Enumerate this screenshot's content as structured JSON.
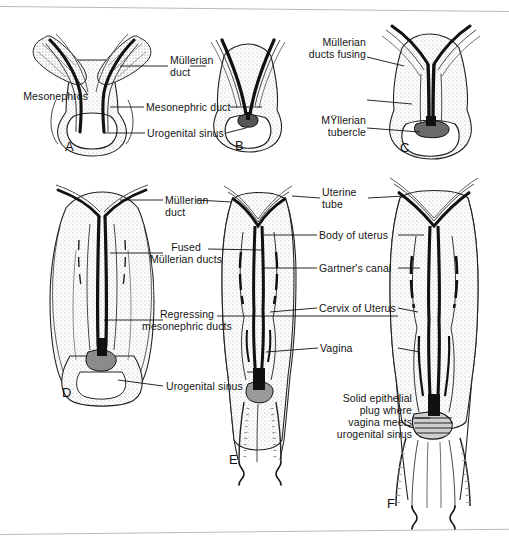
{
  "figure": {
    "background_color": "#ffffff",
    "ink_color": "#111111",
    "stipple_color": "#9a9a9a"
  },
  "panels": [
    {
      "id": "A",
      "letter": "A",
      "stage": "Paired Müllerian ducts alongside mesonephros"
    },
    {
      "id": "B",
      "letter": "B",
      "stage": "Müllerian ducts approaching midline"
    },
    {
      "id": "C",
      "letter": "C",
      "stage": "Müllerian ducts fusing, Müllerian tubercle formed"
    },
    {
      "id": "D",
      "letter": "D",
      "stage": "Fused Müllerian ducts, mesonephric ducts regressing"
    },
    {
      "id": "E",
      "letter": "E",
      "stage": "Uterus and vagina differentiating, Gartner's canal remnant"
    },
    {
      "id": "F",
      "letter": "F",
      "stage": "Solid epithelial vaginal plug at urogenital sinus"
    }
  ],
  "labels": {
    "mesonephros": "Mesonephros",
    "mullerian_duct": "Müllerian\nduct",
    "mesonephric_duct": "Mesonephric duct",
    "urogenital_sinus": "Urogenital sinus",
    "mullerian_ducts_fusing": "Müllerian\nducts fusing",
    "mullerian_tubercle": "MŸllerian\ntubercle",
    "mullerian_duct_2": "Müllerian\nduct",
    "fused_mullerian_ducts": "Fused\nMüllerian ducts",
    "regressing_mesonephric_ducts": "Regressing\nmesonephric ducts",
    "urogenital_sinus_2": "Urogenital sinus",
    "uterine_tube": "Uterine\ntube",
    "body_of_uterus": "Body of uterus",
    "gartners_canal": "Gartner's canal",
    "cervix_of_uterus": "Cervix of Uterus",
    "vagina": "Vagina",
    "solid_epithelial_plug": "Solid epithelial\nplug where\nvagina meets\nurogenital sinus"
  }
}
